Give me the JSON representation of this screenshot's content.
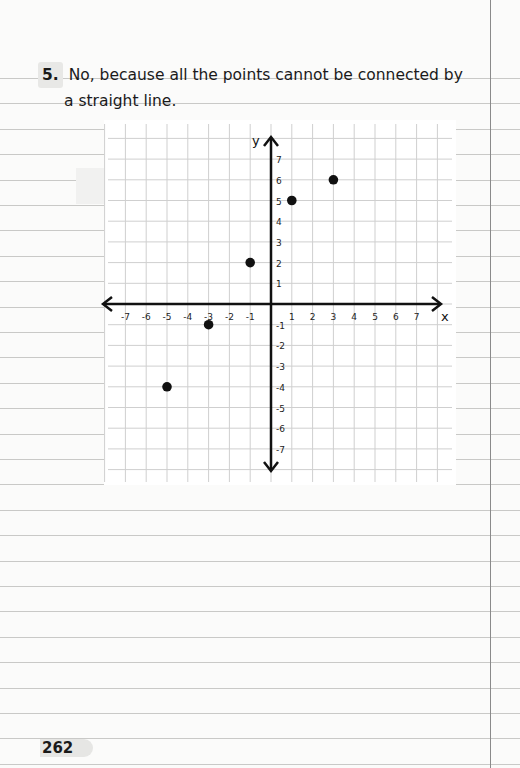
{
  "question": {
    "number": "5.",
    "line1": "No, because all the points cannot be connected by",
    "line2": "a straight line."
  },
  "page_number": "262",
  "chart_data": {
    "type": "scatter",
    "title": "",
    "xlabel": "x",
    "ylabel": "y",
    "xlim": [
      -7,
      7
    ],
    "ylim": [
      -7,
      7
    ],
    "grid": true,
    "x_ticks": [
      "-7",
      "-6",
      "-5",
      "-4",
      "-3",
      "-2",
      "-1",
      "1",
      "2",
      "3",
      "4",
      "5",
      "6",
      "7"
    ],
    "y_ticks": [
      "7",
      "6",
      "5",
      "4",
      "3",
      "2",
      "1",
      "-1",
      "-2",
      "-3",
      "-4",
      "-5",
      "-6",
      "-7"
    ],
    "points": [
      {
        "x": -5,
        "y": -4
      },
      {
        "x": -3,
        "y": -1
      },
      {
        "x": -1,
        "y": 2
      },
      {
        "x": 1,
        "y": 5
      },
      {
        "x": 3,
        "y": 6
      }
    ]
  }
}
